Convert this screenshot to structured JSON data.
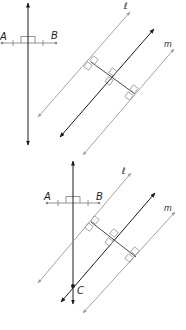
{
  "figure": {
    "colors": {
      "dark_line": "#1a1a1a",
      "light_line": "#9a9a9a",
      "segment": "#888888"
    },
    "panels": [
      {
        "id": "top",
        "labels": {
          "A": "A",
          "B": "B",
          "l": "ℓ",
          "m": "m"
        }
      },
      {
        "id": "bottom",
        "labels": {
          "A": "A",
          "B": "B",
          "l": "ℓ",
          "m": "m",
          "C": "C"
        }
      }
    ]
  }
}
